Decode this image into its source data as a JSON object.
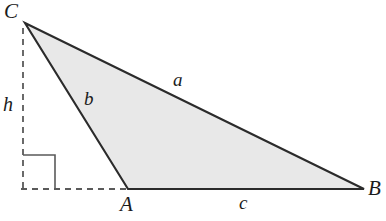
{
  "figure": {
    "width": 386,
    "height": 221,
    "background_color": "#ffffff",
    "fill_color": "#e8e8e8",
    "stroke_color": "#2b2b2b",
    "dash_color": "#5a5a5a",
    "stroke_width": 2,
    "dash_width": 1.6,
    "dash_pattern": "6,5"
  },
  "vertices": [
    {
      "name": "C",
      "label": "C",
      "x": 25,
      "y": 23,
      "label_x": 4,
      "label_y": 1
    },
    {
      "name": "A",
      "label": "A",
      "x": 128,
      "y": 189,
      "label_x": 120,
      "label_y": 195
    },
    {
      "name": "B",
      "label": "B",
      "x": 364,
      "y": 189,
      "label_x": 368,
      "label_y": 178
    }
  ],
  "sides": [
    {
      "name": "a",
      "label": "a",
      "from": "C",
      "to": "B",
      "label_x": 173,
      "label_y": 71
    },
    {
      "name": "b",
      "label": "b",
      "from": "C",
      "to": "A",
      "label_x": 84,
      "label_y": 89
    },
    {
      "name": "c",
      "label": "c",
      "from": "A",
      "to": "B",
      "label_x": 239,
      "label_y": 193
    }
  ],
  "altitude": {
    "name": "h",
    "label": "h",
    "label_x": 3,
    "label_y": 94,
    "foot_x": 23,
    "foot_y": 189,
    "apex_x": 23,
    "apex_y": 28,
    "baseline_from_x": 22,
    "baseline_to_x": 130,
    "baseline_y": 189
  },
  "right_angle_marker": {
    "name": "right-angle",
    "x": 23,
    "y": 155,
    "size": 32
  },
  "polygon_points": "25,23 128,189 364,189",
  "triangle_path": "M 25 23 L 364 189 L 128 189 Z"
}
